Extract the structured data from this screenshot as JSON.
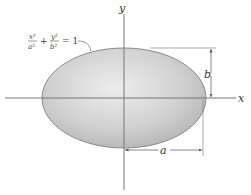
{
  "diagram": {
    "axes": {
      "x_label": "x",
      "y_label": "y"
    },
    "ellipse": {
      "equation": {
        "term1_num": "x²",
        "term1_den": "a²",
        "plus": "+",
        "term2_num": "y²",
        "term2_den": "b²",
        "equals": "= 1"
      },
      "fill_color": "#c8c8c8",
      "edge_color": "#8a8a8a"
    },
    "dimensions": {
      "semi_major_label": "a",
      "semi_minor_label": "b"
    }
  }
}
